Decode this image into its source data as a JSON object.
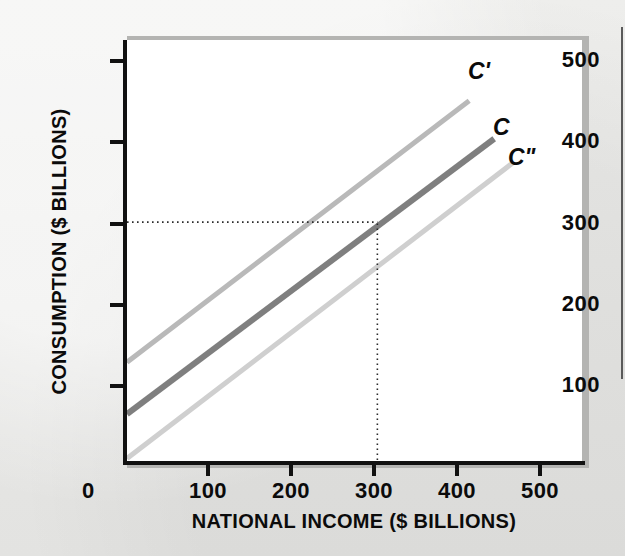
{
  "figure": {
    "background_color": "#e9e9e7",
    "plot_background": "#ffffff",
    "axis_color": "#111111"
  },
  "axes": {
    "y_title": "CONSUMPTION ($ BILLIONS)",
    "x_title": "NATIONAL INCOME ($ BILLIONS)",
    "origin_label": "0",
    "y_ticks": [
      "100",
      "200",
      "300",
      "400",
      "500"
    ],
    "x_ticks": [
      "100",
      "200",
      "300",
      "400",
      "500"
    ]
  },
  "curve_labels": {
    "upper": "C'",
    "middle": "C",
    "lower": "C\""
  },
  "chart_data": {
    "type": "line",
    "title": "",
    "xlabel": "NATIONAL INCOME ($ BILLIONS)",
    "ylabel": "CONSUMPTION ($ BILLIONS)",
    "xlim": [
      0,
      550
    ],
    "ylim": [
      0,
      525
    ],
    "xticks": [
      0,
      100,
      200,
      300,
      400,
      500
    ],
    "yticks": [
      0,
      100,
      200,
      300,
      400,
      500
    ],
    "grid": false,
    "legend": "inline-end-labels",
    "series": [
      {
        "name": "C'",
        "label": "C'",
        "color": "#b9b9b9",
        "linewidth": 5,
        "description": "Upward shifted consumption function",
        "x": [
          0,
          410
        ],
        "y": [
          127,
          450
        ],
        "intercept": 127,
        "slope": 0.79
      },
      {
        "name": "C",
        "label": "C",
        "color": "#7f7f7f",
        "linewidth": 6,
        "description": "Original consumption function, passes through (300, 300)",
        "x": [
          0,
          440
        ],
        "y": [
          63,
          403
        ],
        "intercept": 63,
        "slope": 0.79
      },
      {
        "name": "C\"",
        "label": "C\"",
        "color": "#cfcfcf",
        "linewidth": 5,
        "description": "Downward shifted consumption function",
        "x": [
          0,
          462
        ],
        "y": [
          8,
          373
        ],
        "intercept": 8,
        "slope": 0.79
      }
    ],
    "annotations": [
      {
        "type": "guide-line",
        "style": "dotted",
        "orientation": "horizontal",
        "value": 300,
        "from_x": 0,
        "to_x": 300,
        "label": "300"
      },
      {
        "type": "guide-line",
        "style": "dotted",
        "orientation": "vertical",
        "value": 300,
        "from_y": 0,
        "to_y": 300,
        "label": "300"
      },
      {
        "type": "reference-point",
        "x": 300,
        "y": 300,
        "on_series": "C"
      }
    ]
  }
}
